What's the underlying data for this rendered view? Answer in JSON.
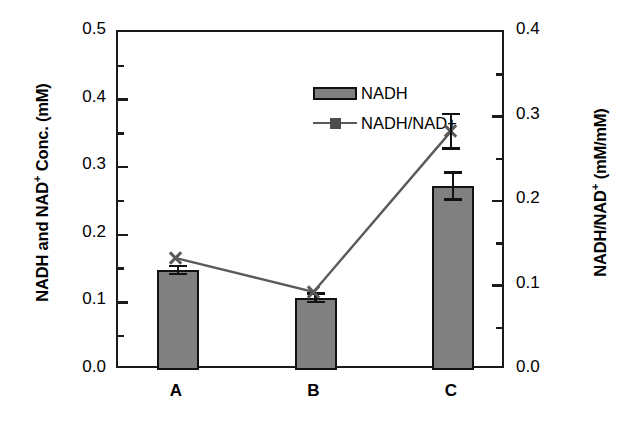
{
  "chart_data": {
    "type": "bar",
    "title": "",
    "subtitle": "",
    "categories": [
      "A",
      "B",
      "C"
    ],
    "xlabel": "",
    "grid": false,
    "legend_position": "top-left-inside",
    "series": [
      {
        "name": "NADH",
        "type": "bar",
        "axis": "left",
        "values": [
          0.148,
          0.107,
          0.272
        ],
        "errors": [
          0.008,
          0.008,
          0.022
        ],
        "fill_color": "#808080",
        "edge_color": "#121212"
      },
      {
        "name": "NADH/NAD+",
        "type": "line",
        "axis": "right",
        "marker": "x",
        "values": [
          0.13,
          0.09,
          0.28
        ],
        "errors": [
          0.0,
          0.0,
          0.022
        ],
        "line_color": "#5a5a5a",
        "marker_color": "#595959"
      }
    ],
    "left_axis": {
      "label": "NADH and NAD+ Conc. (mM)",
      "label_main": "NADH and NAD",
      "label_sup": "+",
      "label_tail": " Conc. (mM)",
      "ylim": [
        0.0,
        0.5
      ],
      "ticks": [
        "0.0",
        "0.1",
        "0.2",
        "0.3",
        "0.4",
        "0.5"
      ],
      "tick_values": [
        0.0,
        0.1,
        0.2,
        0.3,
        0.4,
        0.5
      ],
      "minor_tick_values": [
        0.05,
        0.15,
        0.25,
        0.35,
        0.45
      ]
    },
    "right_axis": {
      "label": "NADH/NAD+ (mM/mM)",
      "label_main": "NADH/NAD",
      "label_sup": "+",
      "label_tail": " (mM/mM)",
      "ylim": [
        0.0,
        0.4
      ],
      "ticks": [
        "0.0",
        "0.1",
        "0.2",
        "0.3",
        "0.4"
      ],
      "tick_values": [
        0.0,
        0.1,
        0.2,
        0.3,
        0.4
      ],
      "minor_tick_values": [
        0.05,
        0.15,
        0.25,
        0.35
      ]
    }
  },
  "legend": {
    "items": [
      {
        "label": "NADH"
      },
      {
        "label": "NADH/NAD+"
      }
    ]
  },
  "colors": {
    "bar_fill": "#808080",
    "bar_edge": "#121212",
    "line": "#5a5a5a",
    "axis": "#1a1a1a",
    "background": "#ffffff"
  }
}
